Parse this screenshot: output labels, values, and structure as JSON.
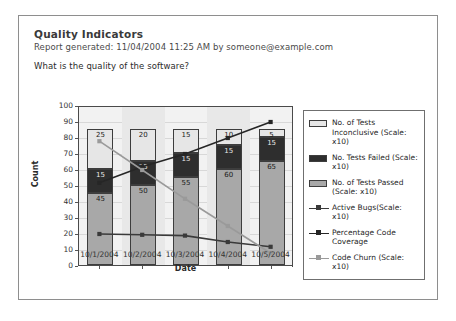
{
  "report": {
    "title": "Quality Indicators",
    "meta": "Report generated:  11/04/2004 11:25 AM by someone@example.com",
    "question": "What is the quality of the software?"
  },
  "legend": {
    "items": [
      {
        "label": "No. of Tests Inconclusive (Scale: x10)",
        "key": "swatch",
        "color": "#e6e6e6"
      },
      {
        "label": "No. Tests Failed (Scale: x10)",
        "key": "swatch",
        "color": "#2e2e2e"
      },
      {
        "label": "No. of Tests Passed (Scale: x10)",
        "key": "swatch",
        "color": "#a8a8a8"
      },
      {
        "label": "Active Bugs(Scale: x10)",
        "key": "line",
        "color": "#3a3a3a"
      },
      {
        "label": "Percentage Code Coverage",
        "key": "line",
        "color": "#262626"
      },
      {
        "label": "Code Churn (Scale: x10)",
        "key": "line",
        "color": "#9a9a9a"
      }
    ]
  },
  "chart_data": {
    "type": "bar",
    "title": "",
    "xlabel": "Date",
    "ylabel": "Count",
    "ylim": [
      0,
      100
    ],
    "yticks": [
      0,
      10,
      20,
      30,
      40,
      50,
      60,
      70,
      80,
      90,
      100
    ],
    "grid": true,
    "legend_position": "right",
    "categories": [
      "10/1/2004",
      "10/2/2004",
      "10/3/2004",
      "10/4/2004",
      "10/5/2004"
    ],
    "stacked": true,
    "series": [
      {
        "name": "No. of Tests Passed (Scale: x10)",
        "type": "bar",
        "color": "#a8a8a8",
        "values": [
          45,
          50,
          55,
          60,
          65
        ]
      },
      {
        "name": "No. Tests Failed (Scale: x10)",
        "type": "bar",
        "color": "#2e2e2e",
        "values": [
          15,
          15,
          15,
          15,
          15
        ]
      },
      {
        "name": "No. of Tests Inconclusive (Scale: x10)",
        "type": "bar",
        "color": "#e6e6e6",
        "values": [
          25,
          20,
          15,
          10,
          5
        ]
      },
      {
        "name": "Active Bugs(Scale: x10)",
        "type": "line",
        "color": "#3a3a3a",
        "values": [
          20,
          19.5,
          19,
          15,
          12
        ]
      },
      {
        "name": "Percentage Code Coverage",
        "type": "line",
        "color": "#262626",
        "values": [
          52,
          62,
          70,
          80,
          90
        ]
      },
      {
        "name": "Code Churn (Scale: x10)",
        "type": "line",
        "color": "#9a9a9a",
        "values": [
          78,
          60,
          42,
          25,
          8
        ]
      }
    ]
  }
}
